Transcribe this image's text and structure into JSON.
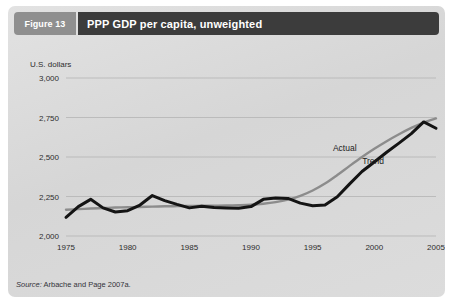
{
  "figure": {
    "number_label": "Figure 13",
    "title": "PPP GDP per capita, unweighted",
    "source_lead": "Source:",
    "source_rest": " Arbache and Page 2007a."
  },
  "colors": {
    "card_bg": "#d9d9d9",
    "number_box": "#8f8f8f",
    "title_box": "#3c3c3c",
    "title_text": "#ffffff",
    "actual_line": "#141414",
    "trend_line": "#8c8c8c",
    "gridline": "#b4b4b4",
    "tick_text": "#2d2d2d"
  },
  "chart_data": {
    "type": "line",
    "title": "PPP GDP per capita, unweighted",
    "xlabel": "",
    "ylabel": "U.S. dollars",
    "ylim": [
      2000,
      3000
    ],
    "xlim": [
      1975,
      2005
    ],
    "ytick_labels": [
      "3,000",
      "2,750",
      "2,500",
      "2,250",
      "2,000"
    ],
    "ytick_values": [
      3000,
      2750,
      2500,
      2250,
      2000
    ],
    "xtick_labels": [
      "1975",
      "1980",
      "1985",
      "1990",
      "1995",
      "2000",
      "2005"
    ],
    "xtick_values": [
      1975,
      1980,
      1985,
      1990,
      1995,
      2000,
      2005
    ],
    "grid": "horizontal",
    "legend": "inline-annotations",
    "annotations": [
      {
        "text": "Actual",
        "x": 1997.6,
        "y": 2535
      },
      {
        "text": "Trend",
        "x": 1999.9,
        "y": 2455
      }
    ],
    "x": [
      1975,
      1976,
      1977,
      1978,
      1979,
      1980,
      1981,
      1982,
      1983,
      1984,
      1985,
      1986,
      1987,
      1988,
      1989,
      1990,
      1991,
      1992,
      1993,
      1994,
      1995,
      1996,
      1997,
      1998,
      1999,
      2000,
      2001,
      2002,
      2003,
      2004,
      2005
    ],
    "series": [
      {
        "name": "Actual",
        "color": "#141414",
        "values": [
          2118,
          2186,
          2232,
          2178,
          2152,
          2160,
          2196,
          2256,
          2224,
          2200,
          2178,
          2188,
          2180,
          2178,
          2176,
          2186,
          2232,
          2240,
          2238,
          2208,
          2192,
          2196,
          2248,
          2330,
          2408,
          2468,
          2530,
          2588,
          2648,
          2722,
          2682
        ]
      },
      {
        "name": "Trend",
        "color": "#8c8c8c",
        "values": [
          2166,
          2170,
          2174,
          2177,
          2180,
          2182,
          2184,
          2186,
          2188,
          2189,
          2190,
          2191,
          2192,
          2193,
          2195,
          2198,
          2204,
          2214,
          2230,
          2254,
          2288,
          2332,
          2386,
          2444,
          2500,
          2552,
          2600,
          2644,
          2684,
          2718,
          2744
        ]
      }
    ]
  }
}
